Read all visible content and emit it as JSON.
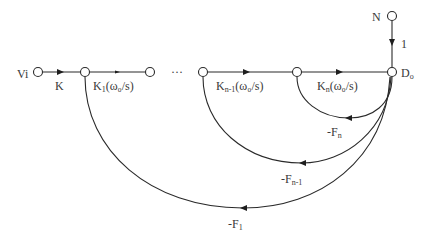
{
  "diagram": {
    "type": "signal-flow-graph",
    "colors": {
      "line": "#2a2a2a",
      "text": "#3a3a3a",
      "background": "#ffffff"
    },
    "nodes": [
      {
        "id": "Vi",
        "label": "Vi",
        "x": 38,
        "y": 72
      },
      {
        "id": "n1",
        "label": "",
        "x": 85,
        "y": 72
      },
      {
        "id": "n2",
        "label": "",
        "x": 150,
        "y": 72
      },
      {
        "id": "nn1",
        "label": "",
        "x": 203,
        "y": 72
      },
      {
        "id": "nn",
        "label": "",
        "x": 297,
        "y": 72
      },
      {
        "id": "D0",
        "label": "D₀",
        "x": 392,
        "y": 72
      },
      {
        "id": "N",
        "label": "N",
        "x": 392,
        "y": 16
      }
    ],
    "ellipsis": "···",
    "forward_branches": [
      {
        "from": "Vi",
        "to": "n1",
        "gain": "K"
      },
      {
        "from": "n1",
        "to": "n2",
        "gain_main": "K",
        "gain_sub": "1",
        "gain_rest": "(ω₀/s)"
      },
      {
        "from": "nn1",
        "to": "nn",
        "gain_main": "K",
        "gain_sub": "n-1",
        "gain_rest": "(ω₀/s)"
      },
      {
        "from": "nn",
        "to": "D0",
        "gain_main": "K",
        "gain_sub": "n",
        "gain_rest": "(ω₀/s)"
      },
      {
        "from": "N",
        "to": "D0",
        "gain": "1"
      }
    ],
    "feedback_branches": [
      {
        "from": "D0",
        "to": "nn",
        "gain_main": "-F",
        "gain_sub": "n"
      },
      {
        "from": "D0",
        "to": "nn1",
        "gain_main": "-F",
        "gain_sub": "n-1"
      },
      {
        "from": "D0",
        "to": "n1",
        "gain_main": "-F",
        "gain_sub": "1"
      }
    ],
    "labels": {
      "vi": "Vi",
      "k": "K",
      "k1_main": "K",
      "k1_sub": "1",
      "k1_rest": "(ω₀/s)",
      "kn1_main": "K",
      "kn1_sub": "n-1",
      "kn1_rest": "(ω₀/s)",
      "kn_main": "K",
      "kn_sub": "n",
      "kn_rest": "(ω₀/s)",
      "d0_main": "D",
      "d0_sub": "o",
      "n": "N",
      "one": "1",
      "fn_main": "-F",
      "fn_sub": "n",
      "fn1_main": "-F",
      "fn1_sub": "n-1",
      "f1_main": "-F",
      "f1_sub": "1",
      "ellipsis": "···"
    }
  }
}
